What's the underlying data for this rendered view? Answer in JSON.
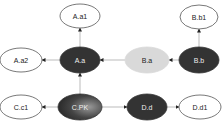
{
  "diagram": {
    "nodes": [
      {
        "id": "Aa1",
        "label": "A.a1",
        "style": "outline"
      },
      {
        "id": "Bb1",
        "label": "B.b1",
        "style": "outline"
      },
      {
        "id": "Aa2",
        "label": "A.a2",
        "style": "outline"
      },
      {
        "id": "Aa",
        "label": "A.a",
        "style": "dark"
      },
      {
        "id": "Ba",
        "label": "B.a",
        "style": "light"
      },
      {
        "id": "Bb",
        "label": "B.b",
        "style": "dark"
      },
      {
        "id": "Cc1",
        "label": "C.c1",
        "style": "outline"
      },
      {
        "id": "CPK",
        "label": "C.PK",
        "style": "gradient"
      },
      {
        "id": "Dd",
        "label": "D.d",
        "style": "dark"
      },
      {
        "id": "Dd1",
        "label": "D.d1",
        "style": "outline"
      }
    ],
    "edges": [
      {
        "from": "Aa",
        "to": "Aa1"
      },
      {
        "from": "Aa",
        "to": "Aa2"
      },
      {
        "from": "Ba",
        "to": "Aa"
      },
      {
        "from": "Bb",
        "to": "Ba"
      },
      {
        "from": "Bb",
        "to": "Bb1"
      },
      {
        "from": "CPK",
        "to": "Aa"
      },
      {
        "from": "CPK",
        "to": "Cc1"
      },
      {
        "from": "CPK",
        "to": "Dd"
      },
      {
        "from": "Dd",
        "to": "Dd1"
      }
    ],
    "colors": {
      "dark": "#333333",
      "light": "#d9d9d9",
      "outline_stroke": "#555555",
      "edge": "#bbbbbb",
      "arrow": "#222222"
    }
  }
}
